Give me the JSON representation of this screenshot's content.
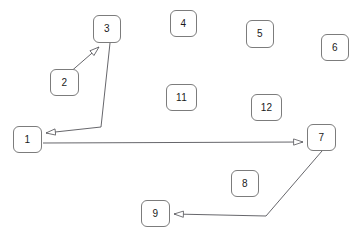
{
  "diagram": {
    "canvas": {
      "width": 359,
      "height": 237,
      "background": "#ffffff"
    },
    "style": {
      "box_stroke": "#7c7c7c",
      "box_fill": "#ffffff",
      "edge_stroke": "#55555a",
      "label_color": "#1a1a1a"
    },
    "nodes": [
      {
        "id": "n1",
        "label": "1",
        "x": 13,
        "y": 126,
        "w": 29,
        "h": 27
      },
      {
        "id": "n2",
        "label": "2",
        "x": 50,
        "y": 69,
        "w": 29,
        "h": 27
      },
      {
        "id": "n3",
        "label": "3",
        "x": 93,
        "y": 15,
        "w": 28,
        "h": 28
      },
      {
        "id": "n4",
        "label": "4",
        "x": 170,
        "y": 10,
        "w": 27,
        "h": 27
      },
      {
        "id": "n5",
        "label": "5",
        "x": 246,
        "y": 20,
        "w": 28,
        "h": 28
      },
      {
        "id": "n6",
        "label": "6",
        "x": 321,
        "y": 34,
        "w": 28,
        "h": 27
      },
      {
        "id": "n11",
        "label": "11",
        "x": 166,
        "y": 84,
        "w": 31,
        "h": 27
      },
      {
        "id": "n12",
        "label": "12",
        "x": 251,
        "y": 94,
        "w": 31,
        "h": 27
      },
      {
        "id": "n7",
        "label": "7",
        "x": 307,
        "y": 124,
        "w": 29,
        "h": 27
      },
      {
        "id": "n8",
        "label": "8",
        "x": 231,
        "y": 170,
        "w": 28,
        "h": 27
      },
      {
        "id": "n9",
        "label": "9",
        "x": 141,
        "y": 200,
        "w": 29,
        "h": 27
      }
    ],
    "edges": [
      {
        "id": "e2-3",
        "from": "n2",
        "to": "n3",
        "points": "68,74 99,47",
        "arrow_at": "end"
      },
      {
        "id": "e3-1",
        "from": "n3",
        "to": "n1",
        "points": "110,43 101,127 46,133",
        "arrow_at": "end"
      },
      {
        "id": "e1-7",
        "from": "n1",
        "to": "n7",
        "points": "43,143 303,142",
        "arrow_at": "end"
      },
      {
        "id": "e7-9",
        "from": "n7",
        "to": "n9",
        "points": "322,151 266,216 174,214",
        "arrow_at": "end"
      }
    ]
  }
}
